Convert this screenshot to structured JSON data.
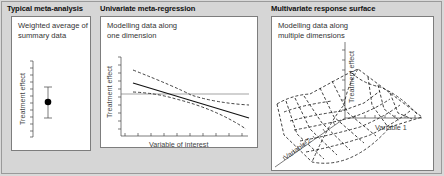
{
  "panels": [
    {
      "title": "Typical meta-analysis",
      "description_lines": [
        "Weighted average of",
        "summary data"
      ],
      "y_axis_label": "Treatment effect"
    },
    {
      "title": "Univariate meta-regression",
      "description_lines": [
        "Modelling data along",
        "one dimension"
      ],
      "y_axis_label": "Treatment effect",
      "x_axis_label": "Variable of interest"
    },
    {
      "title": "Multivariate response surface",
      "description_lines": [
        "Modelling data along",
        "multiple dimensions"
      ],
      "z_axis_label": "Treatment effect",
      "x_axis_label": "Variable 1",
      "y_axis_label": "Variable 2"
    }
  ],
  "colors": {
    "background": "#d6d6d6",
    "panel": "#ffffff",
    "ink": "#111111"
  }
}
